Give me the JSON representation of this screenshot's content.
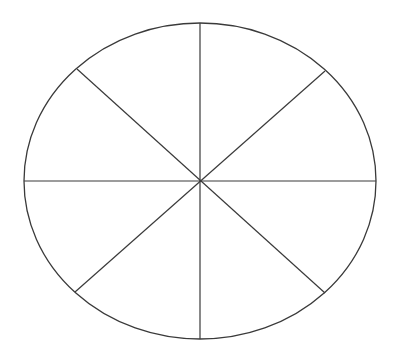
{
  "diagram": {
    "type": "segmented-ellipse",
    "segments": 8,
    "stroke_color": "#3a3a3a",
    "background_color": "#ffffff",
    "ellipse": {
      "cx": 200,
      "cy": 181,
      "rx": 176,
      "ry": 158
    },
    "spokes": [
      {
        "x1": 200,
        "y1": 23,
        "x2": 200,
        "y2": 339
      },
      {
        "x1": 24,
        "y1": 181,
        "x2": 376,
        "y2": 181
      },
      {
        "x1": 77,
        "y1": 69,
        "x2": 325,
        "y2": 293
      },
      {
        "x1": 325,
        "y1": 71,
        "x2": 75,
        "y2": 292
      }
    ]
  }
}
